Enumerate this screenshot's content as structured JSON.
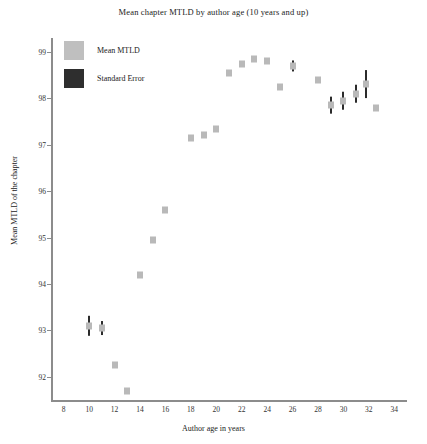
{
  "chart_data": {
    "type": "scatter",
    "title": "Mean chapter MTLD by author age (10 years and up)",
    "xlabel": "Author age in years",
    "ylabel": "Mean MTLD of the chapter",
    "xlim": [
      7,
      35
    ],
    "ylim": [
      91.5,
      99.3
    ],
    "xticks": [
      8,
      10,
      12,
      14,
      16,
      18,
      20,
      22,
      24,
      26,
      28,
      30,
      32,
      34
    ],
    "yticks": [
      92,
      93,
      94,
      95,
      96,
      97,
      98,
      99
    ],
    "grid": false,
    "legend_position": "top-left",
    "legend": [
      {
        "key": "mean",
        "label": "Mean MTLD",
        "color": "#bfbfbf"
      },
      {
        "key": "error",
        "label": "Standard Error",
        "color": "#2e2e2e"
      }
    ],
    "series": [
      {
        "name": "Mean MTLD",
        "marker_color": "#b9b9b9",
        "error_color": "#2b2b2b",
        "points": [
          {
            "x": 10,
            "y": 93.1,
            "err": 0.22
          },
          {
            "x": 11,
            "y": 93.05,
            "err": 0.15
          },
          {
            "x": 12,
            "y": 92.25,
            "err": 0.0
          },
          {
            "x": 13,
            "y": 91.7,
            "err": 0.0
          },
          {
            "x": 14,
            "y": 94.2,
            "err": 0.0
          },
          {
            "x": 15,
            "y": 94.95,
            "err": 0.0
          },
          {
            "x": 16,
            "y": 95.6,
            "err": 0.0
          },
          {
            "x": 18,
            "y": 97.15,
            "err": 0.0
          },
          {
            "x": 19,
            "y": 97.2,
            "err": 0.0
          },
          {
            "x": 20,
            "y": 97.35,
            "err": 0.0
          },
          {
            "x": 21,
            "y": 98.55,
            "err": 0.0
          },
          {
            "x": 22,
            "y": 98.75,
            "err": 0.0
          },
          {
            "x": 23,
            "y": 98.85,
            "err": 0.0
          },
          {
            "x": 24,
            "y": 98.8,
            "err": 0.0
          },
          {
            "x": 25,
            "y": 98.25,
            "err": 0.0
          },
          {
            "x": 26,
            "y": 98.7,
            "err": 0.12
          },
          {
            "x": 28,
            "y": 98.4,
            "err": 0.0
          },
          {
            "x": 29,
            "y": 97.85,
            "err": 0.18
          },
          {
            "x": 30,
            "y": 97.95,
            "err": 0.2
          },
          {
            "x": 31,
            "y": 98.1,
            "err": 0.2
          },
          {
            "x": 31.8,
            "y": 98.3,
            "err": 0.3
          },
          {
            "x": 32.6,
            "y": 97.8,
            "err": 0.0
          }
        ]
      }
    ]
  }
}
